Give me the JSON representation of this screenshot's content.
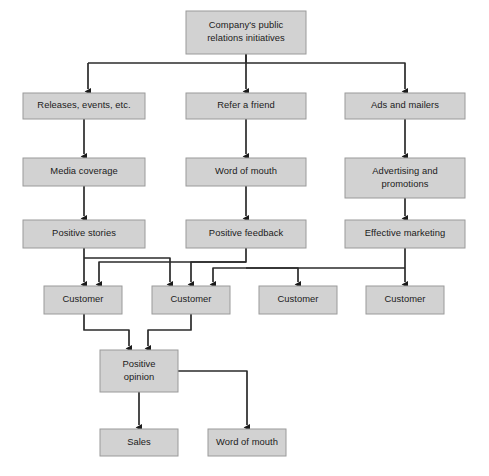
{
  "diagram": {
    "colors": {
      "node_fill": "#d2d2d2",
      "node_border": "#9a9a9a",
      "edge": "#2b2b2b",
      "text": "#1b1b1b",
      "background": "#ffffff"
    },
    "nodes": [
      {
        "id": "root",
        "lines": [
          "Company's public",
          "relations initiatives"
        ],
        "x": 186,
        "y": 11,
        "w": 120,
        "h": 43
      },
      {
        "id": "releases",
        "lines": [
          "Releases, events, etc."
        ],
        "x": 23,
        "y": 93,
        "w": 122,
        "h": 26
      },
      {
        "id": "refer",
        "lines": [
          "Refer a friend"
        ],
        "x": 186,
        "y": 93,
        "w": 120,
        "h": 26
      },
      {
        "id": "ads",
        "lines": [
          "Ads and mailers"
        ],
        "x": 345,
        "y": 93,
        "w": 120,
        "h": 26
      },
      {
        "id": "media",
        "lines": [
          "Media coverage"
        ],
        "x": 23,
        "y": 158,
        "w": 122,
        "h": 28
      },
      {
        "id": "wordmouth1",
        "lines": [
          "Word of mouth"
        ],
        "x": 186,
        "y": 158,
        "w": 120,
        "h": 28
      },
      {
        "id": "advertising",
        "lines": [
          "Advertising and",
          "promotions"
        ],
        "x": 345,
        "y": 158,
        "w": 120,
        "h": 40
      },
      {
        "id": "stories",
        "lines": [
          "Positive stories"
        ],
        "x": 23,
        "y": 220,
        "w": 122,
        "h": 28
      },
      {
        "id": "feedback",
        "lines": [
          "Positive feedback"
        ],
        "x": 186,
        "y": 220,
        "w": 120,
        "h": 28
      },
      {
        "id": "marketing",
        "lines": [
          "Effective marketing"
        ],
        "x": 345,
        "y": 220,
        "w": 120,
        "h": 28
      },
      {
        "id": "cust1",
        "lines": [
          "Customer"
        ],
        "x": 44,
        "y": 286,
        "w": 78,
        "h": 28
      },
      {
        "id": "cust2",
        "lines": [
          "Customer"
        ],
        "x": 152,
        "y": 286,
        "w": 78,
        "h": 28
      },
      {
        "id": "cust3",
        "lines": [
          "Customer"
        ],
        "x": 259,
        "y": 286,
        "w": 78,
        "h": 28
      },
      {
        "id": "cust4",
        "lines": [
          "Customer"
        ],
        "x": 366,
        "y": 286,
        "w": 78,
        "h": 28
      },
      {
        "id": "opinion",
        "lines": [
          "Positive",
          "opinion"
        ],
        "x": 100,
        "y": 350,
        "w": 78,
        "h": 42
      },
      {
        "id": "sales",
        "lines": [
          "Sales"
        ],
        "x": 100,
        "y": 429,
        "w": 78,
        "h": 27
      },
      {
        "id": "wordmouth2",
        "lines": [
          "Word of mouth"
        ],
        "x": 208,
        "y": 429,
        "w": 78,
        "h": 27
      }
    ],
    "edges": [
      {
        "id": "root-to-releases",
        "from": "root",
        "to": "releases",
        "path": "M 246 54 L 246 63 M 88 63 L 88 89",
        "elbow": "M 246 63 L 88 63"
      },
      {
        "id": "root-to-refer",
        "from": "root",
        "to": "refer",
        "path": "M 246 54 L 246 89"
      },
      {
        "id": "root-to-ads",
        "from": "root",
        "to": "ads",
        "path": "M 246 63 L 405 63 L 405 89"
      },
      {
        "id": "releases-to-media",
        "from": "releases",
        "to": "media",
        "path": "M 84 119 L 84 154"
      },
      {
        "id": "refer-to-wom",
        "from": "refer",
        "to": "wordmouth1",
        "path": "M 246 119 L 246 154"
      },
      {
        "id": "ads-to-advertising",
        "from": "ads",
        "to": "advertising",
        "path": "M 405 119 L 405 154"
      },
      {
        "id": "media-to-stories",
        "from": "media",
        "to": "stories",
        "path": "M 84 186 L 84 216"
      },
      {
        "id": "wom-to-feedback",
        "from": "wordmouth1",
        "to": "feedback",
        "path": "M 246 186 L 246 216"
      },
      {
        "id": "adv-to-marketing",
        "from": "advertising",
        "to": "marketing",
        "path": "M 405 198 L 405 216"
      },
      {
        "id": "stories-to-cust1",
        "from": "stories",
        "to": "cust1",
        "path": "M 84 248 L 84 282"
      },
      {
        "id": "stories-to-cust2",
        "from": "stories",
        "to": "cust2",
        "path": "M 84 258 L 170 258 L 170 282"
      },
      {
        "id": "feedback-to-cust1",
        "from": "feedback",
        "to": "cust1",
        "path": "M 246 248 L 246 262 L 99 262 L 99 282"
      },
      {
        "id": "feedback-to-cust2",
        "from": "feedback",
        "to": "cust2",
        "path": "M 246 262 L 191 262 L 191 282"
      },
      {
        "id": "feedback-to-cust3",
        "from": "feedback",
        "to": "cust3",
        "path": "M 246 268 L 298 268 L 298 282"
      },
      {
        "id": "marketing-to-cust4",
        "from": "marketing",
        "to": "cust4",
        "path": "M 405 248 L 405 282"
      },
      {
        "id": "marketing-to-cust3",
        "from": "marketing",
        "to": "cust3",
        "path": "M 405 268 L 213 268 L 213 282"
      },
      {
        "id": "cust1-to-opinion",
        "from": "cust1",
        "to": "opinion",
        "path": "M 84 314 L 84 330 L 129 330 L 129 346"
      },
      {
        "id": "cust2-to-opinion",
        "from": "cust2",
        "to": "opinion",
        "path": "M 191 314 L 191 330 L 148 330 L 148 346"
      },
      {
        "id": "opinion-to-sales",
        "from": "opinion",
        "to": "sales",
        "path": "M 139 392 L 139 425"
      },
      {
        "id": "opinion-to-wom2",
        "from": "opinion",
        "to": "wordmouth2",
        "path": "M 178 371 L 247 371 L 247 425"
      }
    ]
  }
}
